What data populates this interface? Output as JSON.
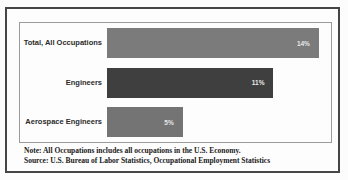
{
  "chart_data": {
    "type": "bar",
    "orientation": "horizontal",
    "title": "",
    "xlabel": "",
    "ylabel": "",
    "categories": [
      "Total, All Occupations",
      "Engineers",
      "Aerospace Engineers"
    ],
    "values": [
      14,
      11,
      5
    ],
    "value_labels": [
      "14%",
      "11%",
      "5%"
    ],
    "bar_colors": [
      "#7b7b7b",
      "#3f3f3f",
      "#747474"
    ],
    "value_label_color": "#e7e7e7",
    "xlim": [
      0,
      14.8
    ],
    "grid": false,
    "legend": "none",
    "axis_ticks_visible": false
  },
  "notes": {
    "note_line": "Note: All Occupations includes all occupations in the U.S. Economy.",
    "source_line": "Source: U.S. Bureau of Labor Statistics, Occupational Employment Statistics"
  },
  "frame": {
    "outer_border_color": "#454545",
    "plot_border_color": "#9b9b9b",
    "background_color": "#fdfdfd"
  }
}
